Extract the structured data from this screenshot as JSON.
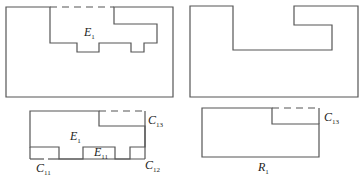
{
  "figures": [
    {
      "id": "top-left",
      "label": {
        "main": "E",
        "sub": "1"
      },
      "description": "Hatched region with open notch region E1 cut from top, dashed top boundary"
    },
    {
      "id": "top-right",
      "label": null,
      "description": "Hatched region with simplified rectangular notch cut from top"
    },
    {
      "id": "bottom-left",
      "labels": [
        {
          "main": "E",
          "sub": "1"
        },
        {
          "main": "E",
          "sub": "11"
        },
        {
          "main": "C",
          "sub": "11"
        },
        {
          "main": "C",
          "sub": "12"
        },
        {
          "main": "C",
          "sub": "13"
        }
      ],
      "description": "Hatched region with boundary components C11, C12, C13 and sub-region E11"
    },
    {
      "id": "bottom-right",
      "labels": [
        {
          "main": "C",
          "sub": "13"
        },
        {
          "main": "R",
          "sub": "1"
        }
      ],
      "description": "Hatched rectangle R1 with notch at top-right, dashed top boundary C13"
    }
  ],
  "labels": {
    "tl_e1": {
      "main": "E",
      "sub": "1"
    },
    "bl_e1": {
      "main": "E",
      "sub": "1"
    },
    "bl_e11": {
      "main": "E",
      "sub": "11"
    },
    "bl_c11": {
      "main": "C",
      "sub": "11"
    },
    "bl_c12": {
      "main": "C",
      "sub": "12"
    },
    "bl_c13": {
      "main": "C",
      "sub": "13"
    },
    "br_c13": {
      "main": "C",
      "sub": "13"
    },
    "br_r1": {
      "main": "R",
      "sub": "1"
    }
  },
  "colors": {
    "stroke": "#555555",
    "hatch": "#9a9a9a",
    "background": "#ffffff"
  }
}
